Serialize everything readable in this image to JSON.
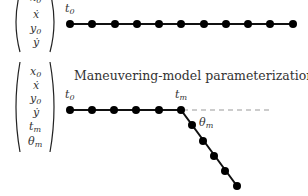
{
  "diagram": {
    "top": {
      "vector": [
        "x0",
        "ẋ",
        "y0",
        "ẏ"
      ],
      "start_label": "t",
      "start_label_sub": "0",
      "points": [
        [
          70,
          24
        ],
        [
          92,
          24
        ],
        [
          115,
          24
        ],
        [
          137,
          24
        ],
        [
          159,
          24
        ],
        [
          181,
          24
        ],
        [
          204,
          24
        ],
        [
          226,
          24
        ],
        [
          248,
          24
        ],
        [
          270,
          24
        ],
        [
          293,
          24
        ]
      ]
    },
    "bottom": {
      "title": "Maneuvering-model parameterization",
      "vector": [
        "x0",
        "ẋ",
        "y0",
        "ẏ",
        "tm",
        "θm"
      ],
      "start_label": "t",
      "start_label_sub": "0",
      "maneuver_label": "t",
      "maneuver_label_sub": "m",
      "angle_label": "θ",
      "angle_label_sub": "m",
      "straight_points": [
        [
          70,
          110
        ],
        [
          92,
          110
        ],
        [
          114,
          110
        ],
        [
          136,
          110
        ],
        [
          159,
          110
        ],
        [
          181,
          110
        ]
      ],
      "turn_points": [
        [
          192,
          125
        ],
        [
          203,
          141
        ],
        [
          214,
          156
        ],
        [
          225,
          171
        ],
        [
          237,
          186
        ]
      ],
      "dashed_extension_end": [
        272,
        110
      ]
    }
  }
}
